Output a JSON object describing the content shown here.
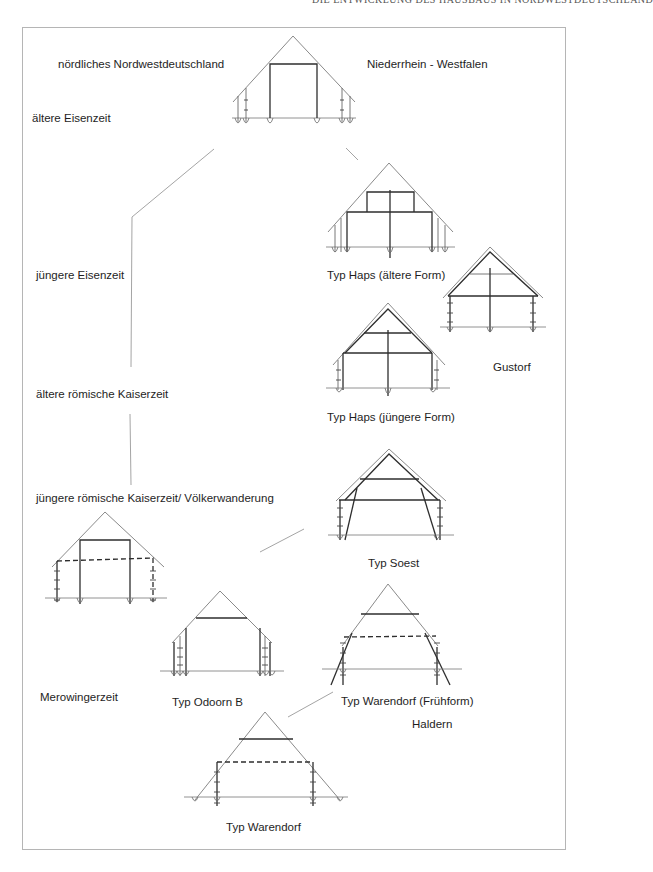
{
  "running_head": "DIE ENTWICKLUNG DES HAUSBAUS IN NORDWESTDEUTSCHLAND",
  "regions": {
    "left": "nördliches Nordwestdeutschland",
    "right": "Niederrhein - Westfalen"
  },
  "periods": [
    {
      "id": "aeltere-eisenzeit",
      "label": "ältere Eisenzeit"
    },
    {
      "id": "juengere-eisenzeit",
      "label": "jüngere Eisenzeit"
    },
    {
      "id": "aeltere-roemische-kaiserzeit",
      "label": "ältere römische Kaiserzeit"
    },
    {
      "id": "juengere-roemische-kaiserzeit",
      "label": "jüngere römische Kaiserzeit/ Völkerwanderung"
    },
    {
      "id": "merowingerzeit",
      "label": "Merowingerzeit"
    }
  ],
  "house_types": [
    {
      "id": "top-house",
      "label": ""
    },
    {
      "id": "haps-aeltere",
      "label": "Typ Haps (ältere Form)"
    },
    {
      "id": "gustorf",
      "label": "Gustorf"
    },
    {
      "id": "haps-juengere",
      "label": "Typ Haps (jüngere Form)"
    },
    {
      "id": "soest",
      "label": "Typ Soest"
    },
    {
      "id": "left-house",
      "label": ""
    },
    {
      "id": "odoorn-b",
      "label": "Typ Odoorn B"
    },
    {
      "id": "warendorf-fruehform",
      "label": "Typ Warendorf (Frühform)"
    },
    {
      "id": "haldern",
      "label": "Haldern"
    },
    {
      "id": "warendorf",
      "label": "Typ Warendorf"
    }
  ],
  "colors": {
    "ink": "#2a2a2a",
    "roof_line": "#8a8a8a",
    "connector": "#9a9a9a",
    "frame": "#b5b5b5"
  }
}
